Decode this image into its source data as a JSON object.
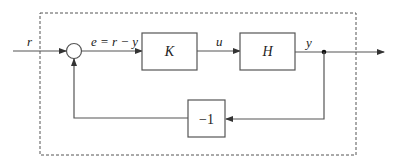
{
  "diagram": {
    "type": "feedback-control-block-diagram",
    "signals": {
      "input": "r",
      "error": "e = r − y",
      "control": "u",
      "output": "y"
    },
    "blocks": [
      {
        "id": "K",
        "label": "K"
      },
      {
        "id": "H",
        "label": "H"
      },
      {
        "id": "neg",
        "label": "−1"
      }
    ],
    "colors": {
      "line": "#555555",
      "text": "#222222",
      "background": "#ffffff"
    }
  }
}
